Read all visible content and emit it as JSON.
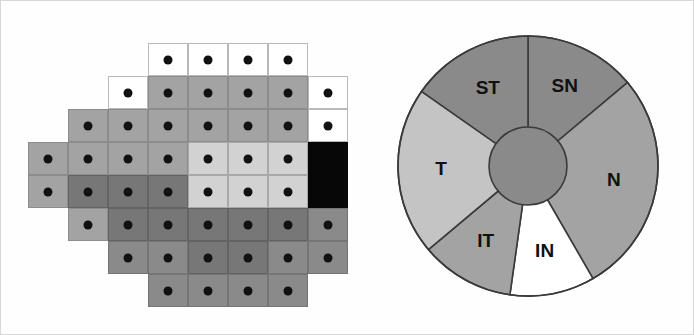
{
  "figure": {
    "background": "#fefefe",
    "border_color": "#d8d8d8"
  },
  "som_map": {
    "name": "self-organizing-map-cluster-plot",
    "cell_width": 40,
    "cell_height": 33,
    "origin_x": 27,
    "origin_y": 42,
    "dot_color": "#111111",
    "shades": {
      "white": "#ffffff",
      "light": "#d2d2d2",
      "mid": "#a3a3a3",
      "dark": "#8a8a8a",
      "darker": "#777777",
      "black": "#070707"
    },
    "cells": [
      {
        "col": 3,
        "row": 0,
        "shade": "white",
        "dot": true
      },
      {
        "col": 4,
        "row": 0,
        "shade": "white",
        "dot": true
      },
      {
        "col": 5,
        "row": 0,
        "shade": "white",
        "dot": true
      },
      {
        "col": 6,
        "row": 0,
        "shade": "white",
        "dot": true
      },
      {
        "col": 2,
        "row": 1,
        "shade": "white",
        "dot": true
      },
      {
        "col": 3,
        "row": 1,
        "shade": "mid",
        "dot": true
      },
      {
        "col": 4,
        "row": 1,
        "shade": "mid",
        "dot": true
      },
      {
        "col": 5,
        "row": 1,
        "shade": "mid",
        "dot": true
      },
      {
        "col": 6,
        "row": 1,
        "shade": "mid",
        "dot": true
      },
      {
        "col": 7,
        "row": 1,
        "shade": "white",
        "dot": true
      },
      {
        "col": 1,
        "row": 2,
        "shade": "mid",
        "dot": true
      },
      {
        "col": 2,
        "row": 2,
        "shade": "mid",
        "dot": true
      },
      {
        "col": 3,
        "row": 2,
        "shade": "mid",
        "dot": true
      },
      {
        "col": 4,
        "row": 2,
        "shade": "mid",
        "dot": true
      },
      {
        "col": 5,
        "row": 2,
        "shade": "mid",
        "dot": true
      },
      {
        "col": 6,
        "row": 2,
        "shade": "mid",
        "dot": true
      },
      {
        "col": 7,
        "row": 2,
        "shade": "white",
        "dot": true
      },
      {
        "col": 0,
        "row": 3,
        "shade": "mid",
        "dot": true
      },
      {
        "col": 1,
        "row": 3,
        "shade": "mid",
        "dot": true
      },
      {
        "col": 2,
        "row": 3,
        "shade": "mid",
        "dot": true
      },
      {
        "col": 3,
        "row": 3,
        "shade": "mid",
        "dot": true
      },
      {
        "col": 4,
        "row": 3,
        "shade": "light",
        "dot": true
      },
      {
        "col": 5,
        "row": 3,
        "shade": "light",
        "dot": true
      },
      {
        "col": 6,
        "row": 3,
        "shade": "light",
        "dot": true
      },
      {
        "col": 7,
        "row": 3,
        "shade": "black",
        "dot": false
      },
      {
        "col": 0,
        "row": 4,
        "shade": "mid",
        "dot": true
      },
      {
        "col": 1,
        "row": 4,
        "shade": "darker",
        "dot": true
      },
      {
        "col": 2,
        "row": 4,
        "shade": "darker",
        "dot": true
      },
      {
        "col": 3,
        "row": 4,
        "shade": "darker",
        "dot": true
      },
      {
        "col": 4,
        "row": 4,
        "shade": "light",
        "dot": true
      },
      {
        "col": 5,
        "row": 4,
        "shade": "light",
        "dot": true
      },
      {
        "col": 6,
        "row": 4,
        "shade": "light",
        "dot": true
      },
      {
        "col": 7,
        "row": 4,
        "shade": "black",
        "dot": false
      },
      {
        "col": 1,
        "row": 5,
        "shade": "mid",
        "dot": true
      },
      {
        "col": 2,
        "row": 5,
        "shade": "darker",
        "dot": true
      },
      {
        "col": 3,
        "row": 5,
        "shade": "darker",
        "dot": true
      },
      {
        "col": 4,
        "row": 5,
        "shade": "darker",
        "dot": true
      },
      {
        "col": 5,
        "row": 5,
        "shade": "darker",
        "dot": true
      },
      {
        "col": 6,
        "row": 5,
        "shade": "darker",
        "dot": true
      },
      {
        "col": 7,
        "row": 5,
        "shade": "dark",
        "dot": true
      },
      {
        "col": 2,
        "row": 6,
        "shade": "dark",
        "dot": true
      },
      {
        "col": 3,
        "row": 6,
        "shade": "dark",
        "dot": true
      },
      {
        "col": 4,
        "row": 6,
        "shade": "darker",
        "dot": true
      },
      {
        "col": 5,
        "row": 6,
        "shade": "darker",
        "dot": true
      },
      {
        "col": 6,
        "row": 6,
        "shade": "dark",
        "dot": true
      },
      {
        "col": 7,
        "row": 6,
        "shade": "dark",
        "dot": true
      },
      {
        "col": 3,
        "row": 7,
        "shade": "dark",
        "dot": true
      },
      {
        "col": 4,
        "row": 7,
        "shade": "dark",
        "dot": true
      },
      {
        "col": 5,
        "row": 7,
        "shade": "dark",
        "dot": true
      },
      {
        "col": 6,
        "row": 7,
        "shade": "dark",
        "dot": true
      }
    ]
  },
  "chart_data": {
    "type": "pie",
    "title": "",
    "xlabel": "",
    "ylabel": "",
    "legend_position": "none",
    "inner_hub": {
      "label": "",
      "color": "#8a8a8a",
      "radius_ratio": 0.3
    },
    "center_x": 137,
    "center_y": 137,
    "radius": 130,
    "categories": [
      "SN",
      "N",
      "IN",
      "IT",
      "T",
      "ST"
    ],
    "values": [
      14,
      25,
      14,
      14,
      19,
      14
    ],
    "start_angle_deg": -90,
    "slices": [
      {
        "label": "SN",
        "start_deg": -90,
        "end_deg": -40,
        "color": "#8a8a8a",
        "label_radius_ratio": 0.67
      },
      {
        "label": "N",
        "start_deg": -40,
        "end_deg": 60,
        "color": "#a3a3a3",
        "label_radius_ratio": 0.67
      },
      {
        "label": "IN",
        "start_deg": 60,
        "end_deg": 98,
        "color": "#ffffff",
        "label_radius_ratio": 0.67
      },
      {
        "label": "IT",
        "start_deg": 98,
        "end_deg": 140,
        "color": "#a3a3a3",
        "label_radius_ratio": 0.67
      },
      {
        "label": "T",
        "start_deg": 140,
        "end_deg": 215,
        "color": "#c4c4c4",
        "label_radius_ratio": 0.67
      },
      {
        "label": "ST",
        "start_deg": 215,
        "end_deg": 270,
        "color": "#8a8a8a",
        "label_radius_ratio": 0.67
      }
    ],
    "stroke_color": "#3a3a3a",
    "stroke_width": 1.6
  }
}
